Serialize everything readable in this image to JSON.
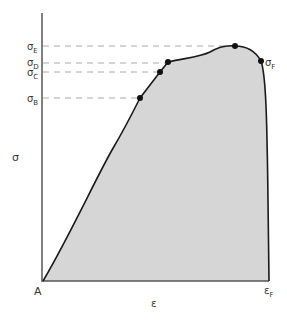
{
  "diagram": {
    "type": "stress-strain curve",
    "axes": {
      "y_label": "σ",
      "x_label": "ε",
      "origin_label": "A",
      "x_end_label_main": "ε",
      "x_end_label_sub": "F"
    },
    "points": [
      {
        "id": "B",
        "label_main": "σ",
        "label_sub": "B"
      },
      {
        "id": "C",
        "label_main": "σ",
        "label_sub": "C"
      },
      {
        "id": "D",
        "label_main": "σ",
        "label_sub": "D"
      },
      {
        "id": "E",
        "label_main": "σ",
        "label_sub": "E"
      },
      {
        "id": "F",
        "label_main": "σ",
        "label_sub": "F"
      }
    ],
    "colors": {
      "fill": "#d6d6d6",
      "curve": "#1a1a1a",
      "axis": "#555555",
      "dash": "#aaaaaa"
    }
  }
}
